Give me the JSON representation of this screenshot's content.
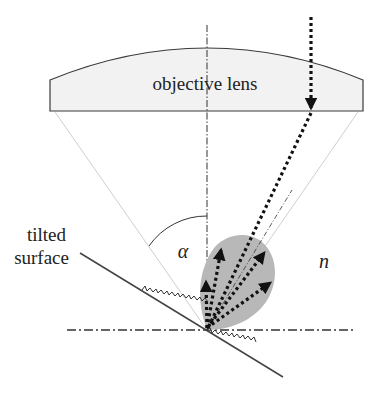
{
  "labels": {
    "lens": "objective lens",
    "surface_line1": "tilted",
    "surface_line2": "surface",
    "angle": "α",
    "index": "n"
  },
  "colors": {
    "lens_fill": "#f2f2f2",
    "lens_stroke": "#3a3a3a",
    "lobe_fill": "#b8b8b8",
    "beam": "#111111",
    "cone": "#c8c8c8",
    "axis": "#333333",
    "surface": "#444444"
  }
}
